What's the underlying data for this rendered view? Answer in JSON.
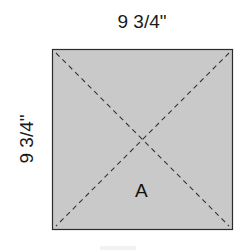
{
  "diagram": {
    "type": "quilt-block-template",
    "shape": "square",
    "fill_color": "#c9c9c9",
    "border_color": "#2b2b2b",
    "diagonal_color": "#333333",
    "diagonals": "dashed",
    "dimensions": {
      "width_label": "9 3/4\"",
      "height_label": "9 3/4\""
    },
    "piece_label": "A"
  }
}
